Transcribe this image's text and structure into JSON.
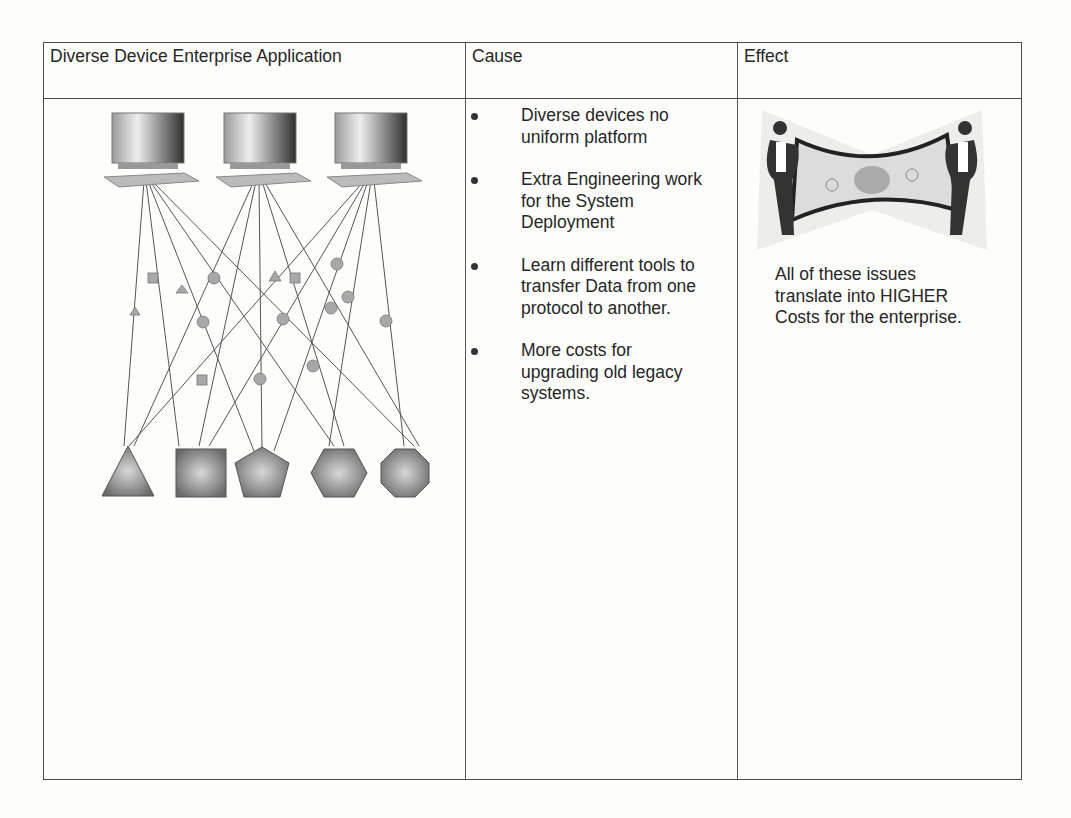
{
  "table": {
    "headers": [
      "Diverse Device Enterprise Application",
      "Cause",
      "Effect"
    ],
    "diagram": {
      "clients": [
        "computer-1",
        "computer-2",
        "computer-3"
      ],
      "devices": [
        "triangle",
        "square",
        "pentagon",
        "hexagon",
        "octagon"
      ]
    },
    "causes": [
      "Diverse devices no uniform platform",
      "Extra Engineering work for the System Deployment",
      "Learn different tools to transfer Data from one protocol to another.",
      "More costs for upgrading old legacy systems."
    ],
    "effect": {
      "image": "businessmen-stretching-dollar-bill",
      "text": "All of these issues translate into HIGHER Costs for the enterprise."
    }
  }
}
